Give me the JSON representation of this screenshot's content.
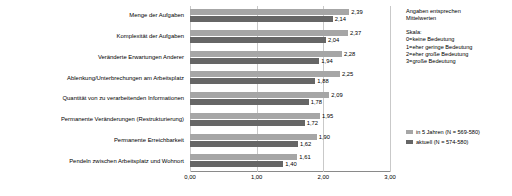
{
  "chart_data": {
    "type": "bar",
    "orientation": "horizontal",
    "title": "",
    "xlabel": "",
    "ylabel": "",
    "xlim": [
      0,
      3
    ],
    "xticks": [
      "0,00",
      "1,00",
      "2,00",
      "3,00"
    ],
    "grid": true,
    "legend_position": "right-bottom",
    "categories": [
      "Menge der Aufgaben",
      "Komplexität der Aufgaben",
      "Veränderte Erwartungen Anderer",
      "Ablenkung/Unterbrechungen am Arbeitsplatz",
      "Quantität von zu verarbeitenden Informationen",
      "Permanente Veränderungen (Restrukturierung)",
      "Permanente Erreichbarkeit",
      "Pendeln zwischen Arbeitsplatz und Wohnort"
    ],
    "series": [
      {
        "name": "in 5 Jahren (N = 569-580)",
        "color": "#a6a6a6",
        "values": [
          2.39,
          2.37,
          2.28,
          2.25,
          2.09,
          1.95,
          1.9,
          1.61
        ],
        "labels": [
          "2,39",
          "2,37",
          "2,28",
          "2,25",
          "2,09",
          "1,95",
          "1,90",
          "1,61"
        ]
      },
      {
        "name": "aktuell (N = 574-580)",
        "color": "#666666",
        "values": [
          2.14,
          2.04,
          1.94,
          1.88,
          1.78,
          1.72,
          1.62,
          1.4
        ],
        "labels": [
          "2,14",
          "2,04",
          "1,94",
          "1,88",
          "1,78",
          "1,72",
          "1,62",
          "1,40"
        ]
      }
    ]
  },
  "side_panel": {
    "note": [
      "Angaben entsprechen",
      "Mittelwerten"
    ],
    "scale_title": "Skala:",
    "scale_items": [
      "0=keine Bedeutung",
      "1=eher geringe Bedeutung",
      "2=eher große Bedeutung",
      "3=große Bedeutung"
    ]
  },
  "legend": {
    "items": [
      {
        "label": "in 5 Jahren (N = 569-580)",
        "color": "#a6a6a6"
      },
      {
        "label": "aktuell (N = 574-580)",
        "color": "#666666"
      }
    ]
  }
}
